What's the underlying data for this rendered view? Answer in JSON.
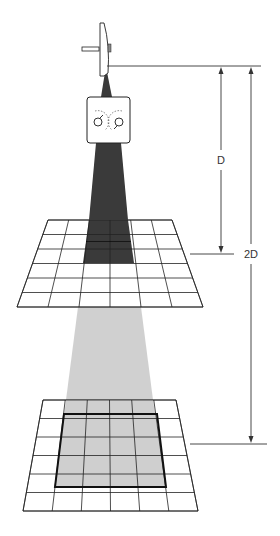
{
  "diagram": {
    "title": "",
    "labels": {
      "distance_1": "D",
      "distance_2": "2D"
    },
    "colors": {
      "line": "#222222",
      "dark_beam": "#3a3a3a",
      "light_beam": "#cfcfcf",
      "grid_fill": "#ffffff",
      "background": "#ffffff"
    },
    "elements": [
      {
        "name": "x-ray-tube-anode",
        "description": "Rotating anode disk source"
      },
      {
        "name": "collimator",
        "description": "Collimator box with two dial symbols"
      },
      {
        "name": "upper-grid",
        "description": "Detector grid at distance D",
        "rows": 6,
        "cols": 6,
        "exposed_cells": "2x4"
      },
      {
        "name": "lower-grid",
        "description": "Detector grid at distance 2D",
        "rows": 6,
        "cols": 6,
        "exposed_cells": "4x4"
      }
    ]
  }
}
